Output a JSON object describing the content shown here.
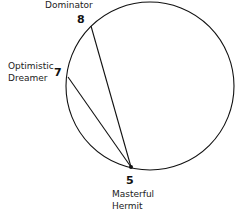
{
  "diagram": {
    "nodes": [
      {
        "id": "8",
        "number": "8",
        "label_lines": [
          "Dominator"
        ]
      },
      {
        "id": "7",
        "number": "7",
        "label_lines": [
          "Optimistic",
          "Dreamer"
        ]
      },
      {
        "id": "5",
        "number": "5",
        "label_lines": [
          "Masterful",
          "Hermit"
        ]
      }
    ],
    "edges": [
      {
        "from": "8",
        "to": "5"
      },
      {
        "from": "7",
        "to": "5"
      }
    ],
    "colors": {
      "stroke": "#111111",
      "text": "#222222",
      "background": "#ffffff"
    }
  }
}
